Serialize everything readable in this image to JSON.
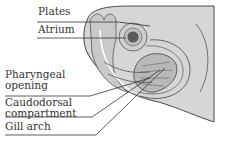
{
  "figure": {
    "labels": [
      {
        "id": "plates",
        "text": "Plates"
      },
      {
        "id": "atrium",
        "text": "Atrium"
      },
      {
        "id": "pharyngeal-opening",
        "text": "Pharyngeal\nopening"
      },
      {
        "id": "caudodorsal-compartment",
        "text": "Caudodorsal\ncompartment"
      },
      {
        "id": "gill-arch",
        "text": "Gill arch"
      }
    ],
    "colors": {
      "body_fill": "#d6d6d6",
      "outline": "#4a4a4a",
      "leader_line": "#333333",
      "text": "#333333"
    }
  }
}
